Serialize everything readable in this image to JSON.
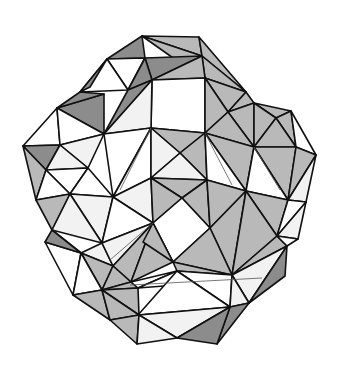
{
  "figure": {
    "colors": {
      "white": "#ffffff",
      "light": "#f2f2f2",
      "mid": "#b9b9b9",
      "dark": "#8c8c8c",
      "line": "#111111"
    },
    "faces": [
      {
        "pts": "142,36 199,37 202,56",
        "shade": "mid"
      },
      {
        "pts": "142,36 202,56 176,60",
        "shade": "mid"
      },
      {
        "pts": "142,36 107,59 145,58",
        "shade": "dark"
      },
      {
        "pts": "145,58 202,56 152,80",
        "shade": "dark"
      },
      {
        "pts": "199,37 246,92 202,56",
        "shade": "mid"
      },
      {
        "pts": "202,56 246,92 205,78",
        "shade": "mid"
      },
      {
        "pts": "152,80 202,56 205,78",
        "shade": "mid"
      },
      {
        "pts": "107,59 145,58 128,90",
        "shade": "white"
      },
      {
        "pts": "107,59 80,92 128,90",
        "shade": "white"
      },
      {
        "pts": "80,92 107,59 90,87",
        "shade": "dark"
      },
      {
        "pts": "128,90 145,58 152,80",
        "shade": "dark"
      },
      {
        "pts": "104,134 128,90 152,80",
        "shade": "dark"
      },
      {
        "pts": "57,108 104,134 104,94",
        "shade": "dark"
      },
      {
        "pts": "57,108 80,92 104,94",
        "shade": "dark"
      },
      {
        "pts": "152,80 205,78 205,133 151,128",
        "shade": "white"
      },
      {
        "pts": "104,134 152,80 151,128",
        "shade": "light"
      },
      {
        "pts": "205,78 246,92 228,112",
        "shade": "mid"
      },
      {
        "pts": "205,78 228,112 205,133",
        "shade": "mid"
      },
      {
        "pts": "246,92 254,103 228,112",
        "shade": "mid"
      },
      {
        "pts": "228,112 254,103 254,147",
        "shade": "mid"
      },
      {
        "pts": "205,133 228,112 254,147",
        "shade": "mid"
      },
      {
        "pts": "254,103 291,111 276,118",
        "shade": "mid"
      },
      {
        "pts": "254,103 276,118 254,147",
        "shade": "mid"
      },
      {
        "pts": "276,118 291,111 296,147",
        "shade": "mid"
      },
      {
        "pts": "254,147 276,118 296,147",
        "shade": "mid"
      },
      {
        "pts": "291,111 316,155 296,147",
        "shade": "white"
      },
      {
        "pts": "23,146 57,108 60,145",
        "shade": "white"
      },
      {
        "pts": "57,108 104,134 60,145",
        "shade": "white"
      },
      {
        "pts": "23,146 60,145 46,170",
        "shade": "dark"
      },
      {
        "pts": "23,146 46,170 36,200",
        "shade": "mid"
      },
      {
        "pts": "60,145 104,134 88,168",
        "shade": "light"
      },
      {
        "pts": "60,145 88,168 46,170",
        "shade": "light"
      },
      {
        "pts": "104,134 151,128 113,197",
        "shade": "white"
      },
      {
        "pts": "151,128 151,178 113,197",
        "shade": "white"
      },
      {
        "pts": "151,128 205,133 180,153",
        "shade": "mid"
      },
      {
        "pts": "151,128 180,153 151,178",
        "shade": "light"
      },
      {
        "pts": "180,153 205,133 207,180",
        "shade": "mid"
      },
      {
        "pts": "151,178 180,153 207,180",
        "shade": "light"
      },
      {
        "pts": "205,133 254,147 246,191",
        "shade": "mid"
      },
      {
        "pts": "205,133 246,191 207,180",
        "shade": "white"
      },
      {
        "pts": "254,147 296,147 288,200",
        "shade": "mid"
      },
      {
        "pts": "254,147 288,200 246,191",
        "shade": "white"
      },
      {
        "pts": "296,147 316,155 288,200",
        "shade": "mid"
      },
      {
        "pts": "316,155 306,202 288,200",
        "shade": "light"
      },
      {
        "pts": "46,170 88,168 70,194",
        "shade": "white"
      },
      {
        "pts": "36,200 46,170 70,194",
        "shade": "white"
      },
      {
        "pts": "88,168 113,197 70,194",
        "shade": "white"
      },
      {
        "pts": "36,200 70,194 52,230",
        "shade": "mid"
      },
      {
        "pts": "70,194 113,197 102,243",
        "shade": "light"
      },
      {
        "pts": "70,194 102,243 52,230",
        "shade": "light"
      },
      {
        "pts": "113,197 151,178 153,223",
        "shade": "light"
      },
      {
        "pts": "113,197 153,223 102,243",
        "shade": "white"
      },
      {
        "pts": "151,178 207,180 182,198",
        "shade": "mid"
      },
      {
        "pts": "151,178 182,198 153,223",
        "shade": "mid"
      },
      {
        "pts": "182,198 207,180 210,228",
        "shade": "mid"
      },
      {
        "pts": "153,223 182,198 210,228 173,262",
        "shade": "white"
      },
      {
        "pts": "207,180 246,191 210,228",
        "shade": "mid"
      },
      {
        "pts": "210,228 246,191 232,275",
        "shade": "mid"
      },
      {
        "pts": "246,191 288,200 277,236",
        "shade": "mid"
      },
      {
        "pts": "246,191 277,236 232,275",
        "shade": "mid"
      },
      {
        "pts": "288,200 306,202 277,236",
        "shade": "white"
      },
      {
        "pts": "306,202 298,239 277,236",
        "shade": "light"
      },
      {
        "pts": "52,230 81,253 60,243",
        "shade": "dark"
      },
      {
        "pts": "45,242 81,253 73,295",
        "shade": "white"
      },
      {
        "pts": "45,242 52,230 81,253",
        "shade": "dark"
      },
      {
        "pts": "81,253 102,243 113,266",
        "shade": "light"
      },
      {
        "pts": "102,243 153,223 113,266",
        "shade": "light"
      },
      {
        "pts": "113,266 153,223 131,282",
        "shade": "mid"
      },
      {
        "pts": "153,223 173,262 131,282",
        "shade": "mid"
      },
      {
        "pts": "153,223 143,242 173,262",
        "shade": "mid"
      },
      {
        "pts": "173,262 210,228 232,275",
        "shade": "mid"
      },
      {
        "pts": "173,262 232,275 177,271",
        "shade": "mid"
      },
      {
        "pts": "232,275 277,236 287,246",
        "shade": "mid"
      },
      {
        "pts": "277,236 298,239 287,246",
        "shade": "white"
      },
      {
        "pts": "232,275 287,246 249,303",
        "shade": "light"
      },
      {
        "pts": "287,246 285,276 249,303",
        "shade": "dark"
      },
      {
        "pts": "81,253 113,266 102,290",
        "shade": "mid"
      },
      {
        "pts": "73,295 81,253 102,290",
        "shade": "white"
      },
      {
        "pts": "113,266 131,282 102,290",
        "shade": "mid"
      },
      {
        "pts": "102,290 131,282 138,288",
        "shade": "mid"
      },
      {
        "pts": "131,282 177,271 138,288",
        "shade": "white"
      },
      {
        "pts": "138,288 177,271 177,285",
        "shade": "white"
      },
      {
        "pts": "177,271 232,275 230,307",
        "shade": "white"
      },
      {
        "pts": "177,271 230,307 138,315",
        "shade": "white"
      },
      {
        "pts": "232,275 249,303 230,307",
        "shade": "light"
      },
      {
        "pts": "73,295 102,290 110,320",
        "shade": "mid"
      },
      {
        "pts": "102,290 138,288 139,315",
        "shade": "mid"
      },
      {
        "pts": "102,290 139,315 110,320",
        "shade": "mid"
      },
      {
        "pts": "110,320 139,315 137,344",
        "shade": "mid"
      },
      {
        "pts": "139,315 230,307 177,338",
        "shade": "light"
      },
      {
        "pts": "139,315 177,338 137,344",
        "shade": "light"
      },
      {
        "pts": "230,307 249,303 217,344",
        "shade": "dark"
      },
      {
        "pts": "177,338 230,307 217,344",
        "shade": "dark"
      }
    ],
    "thin_lines": [
      "151,128 120,190",
      "205,133 232,185",
      "153,223 110,260",
      "254,147 280,190",
      "130,285 262,278"
    ]
  }
}
